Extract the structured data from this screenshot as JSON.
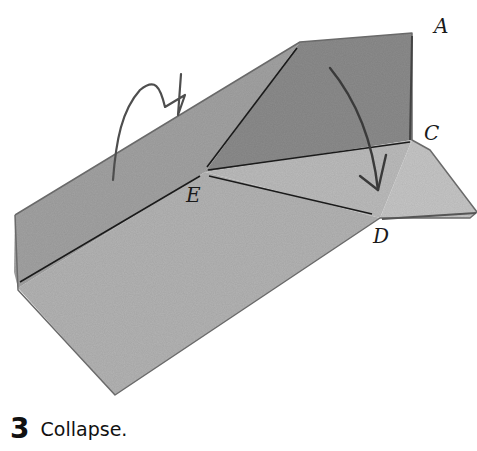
{
  "figure": {
    "labels": {
      "A": "A",
      "C": "C",
      "D": "D",
      "E": "E"
    },
    "arrows": [
      {
        "name": "flip-over-arrow",
        "meaning": "turn flap over"
      },
      {
        "name": "collapse-arrow",
        "meaning": "fold corner down toward D"
      }
    ],
    "colors": {
      "paper_dark": "#8f8f8f",
      "paper_mid": "#a9a9a9",
      "paper_light": "#c4c4c4",
      "crease": "#1a1a1a",
      "arrow": "#555555"
    }
  },
  "caption": {
    "step_number": "3",
    "text": "Collapse."
  }
}
